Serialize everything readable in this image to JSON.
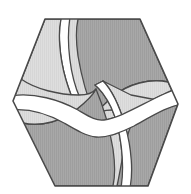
{
  "artwork": {
    "name": "hexagonal-pinwheel-logo",
    "description": "Hexagon logo divided by S-curved white bands into interleaved light and dark gray pinwheel segments",
    "symmetry": "180-degree rotational",
    "background_color": "#ffffff",
    "outline_color": "#4a4a4a",
    "outline_width": 1.3,
    "band_color": "#ffffff",
    "colors": {
      "light_gray": "#dcdcdc",
      "mid_gray": "#c4c4c4",
      "dark_gray": "#a3a3a3"
    },
    "center": {
      "x": 95.5,
      "y": 103
    },
    "hexagon_vertices": [
      {
        "x": 45,
        "y": 19
      },
      {
        "x": 140,
        "y": 19
      },
      {
        "x": 178,
        "y": 104
      },
      {
        "x": 148,
        "y": 186
      },
      {
        "x": 55,
        "y": 186
      },
      {
        "x": 13,
        "y": 101
      }
    ],
    "segments": [
      {
        "name": "upper-left-light-wedge",
        "tone": "light_gray"
      },
      {
        "name": "upper-right-dark-wedge",
        "tone": "dark_gray"
      },
      {
        "name": "upper-right-light-lobe",
        "tone": "light_gray"
      },
      {
        "name": "lower-left-dark-wedge",
        "tone": "dark_gray"
      },
      {
        "name": "lower-left-light-lobe",
        "tone": "light_gray"
      },
      {
        "name": "lower-right-light-wedge",
        "tone": "light_gray"
      },
      {
        "name": "lower-right-dark-lobe",
        "tone": "dark_gray"
      }
    ]
  }
}
